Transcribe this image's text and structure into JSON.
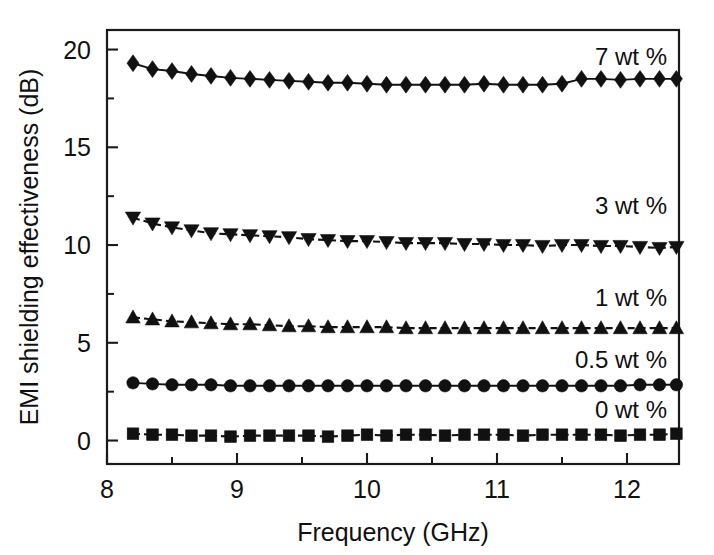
{
  "chart_data": {
    "type": "line",
    "title": "",
    "xlabel": "Frequency (GHz)",
    "ylabel": "EMI shielding effectiveness (dB)",
    "xlim": [
      8.0,
      12.4
    ],
    "ylim": [
      -1.2,
      21.0
    ],
    "xticks": [
      8,
      9,
      10,
      11,
      12
    ],
    "xticklabels": [
      "8",
      "9",
      "10",
      "11",
      "12"
    ],
    "xminorticks": [
      8.5,
      9.5,
      10.5,
      11.5,
      12.0
    ],
    "yticks": [
      0,
      5,
      10,
      15,
      20
    ],
    "yticklabels": [
      "0",
      "5",
      "10",
      "15",
      "20"
    ],
    "yminorticks": [
      2.5,
      7.5,
      12.5,
      17.5
    ],
    "grid": false,
    "legend_position": "inline-right",
    "x": [
      8.2,
      8.35,
      8.5,
      8.65,
      8.8,
      8.95,
      9.1,
      9.25,
      9.4,
      9.55,
      9.7,
      9.85,
      10.0,
      10.15,
      10.3,
      10.45,
      10.6,
      10.75,
      10.9,
      11.05,
      11.2,
      11.35,
      11.5,
      11.65,
      11.8,
      11.95,
      12.1,
      12.25,
      12.38
    ],
    "series": [
      {
        "name": "7 wt %",
        "label": "7 wt %",
        "marker": "diamond",
        "linestyle": "solid",
        "color": "#111111",
        "label_value": 19.6,
        "values": [
          19.3,
          19.0,
          18.9,
          18.75,
          18.65,
          18.55,
          18.5,
          18.45,
          18.4,
          18.35,
          18.3,
          18.3,
          18.25,
          18.2,
          18.2,
          18.2,
          18.2,
          18.2,
          18.25,
          18.2,
          18.2,
          18.2,
          18.25,
          18.5,
          18.5,
          18.45,
          18.5,
          18.5,
          18.5
        ]
      },
      {
        "name": "3 wt %",
        "label": "3 wt %",
        "marker": "triangle-down",
        "linestyle": "dashed",
        "color": "#111111",
        "label_value": 12.0,
        "values": [
          11.4,
          11.1,
          10.9,
          10.75,
          10.6,
          10.55,
          10.5,
          10.45,
          10.4,
          10.3,
          10.25,
          10.2,
          10.2,
          10.15,
          10.1,
          10.1,
          10.1,
          10.05,
          10.05,
          10.0,
          10.0,
          9.95,
          10.0,
          10.0,
          9.95,
          9.95,
          9.9,
          9.85,
          9.9
        ]
      },
      {
        "name": "1 wt %",
        "label": "1 wt %",
        "marker": "triangle-up",
        "linestyle": "dashed",
        "color": "#111111",
        "label_value": 7.3,
        "values": [
          6.3,
          6.2,
          6.1,
          6.05,
          6.0,
          5.95,
          5.95,
          5.9,
          5.85,
          5.85,
          5.8,
          5.8,
          5.8,
          5.8,
          5.75,
          5.75,
          5.75,
          5.75,
          5.75,
          5.75,
          5.75,
          5.75,
          5.75,
          5.75,
          5.75,
          5.75,
          5.75,
          5.75,
          5.75
        ]
      },
      {
        "name": "0.5 wt %",
        "label": "0.5 wt %",
        "marker": "circle",
        "linestyle": "solid",
        "color": "#111111",
        "label_value": 4.1,
        "values": [
          2.95,
          2.9,
          2.85,
          2.85,
          2.85,
          2.8,
          2.8,
          2.8,
          2.8,
          2.8,
          2.8,
          2.8,
          2.8,
          2.8,
          2.8,
          2.8,
          2.8,
          2.8,
          2.8,
          2.8,
          2.8,
          2.8,
          2.8,
          2.8,
          2.8,
          2.8,
          2.85,
          2.85,
          2.85
        ]
      },
      {
        "name": "0 wt %",
        "label": "0 wt %",
        "marker": "square",
        "linestyle": "dashed",
        "color": "#111111",
        "label_value": 1.55,
        "values": [
          0.35,
          0.3,
          0.3,
          0.25,
          0.25,
          0.2,
          0.25,
          0.25,
          0.25,
          0.25,
          0.2,
          0.25,
          0.3,
          0.25,
          0.3,
          0.3,
          0.25,
          0.3,
          0.3,
          0.3,
          0.25,
          0.3,
          0.3,
          0.3,
          0.3,
          0.25,
          0.3,
          0.3,
          0.35
        ]
      }
    ]
  }
}
